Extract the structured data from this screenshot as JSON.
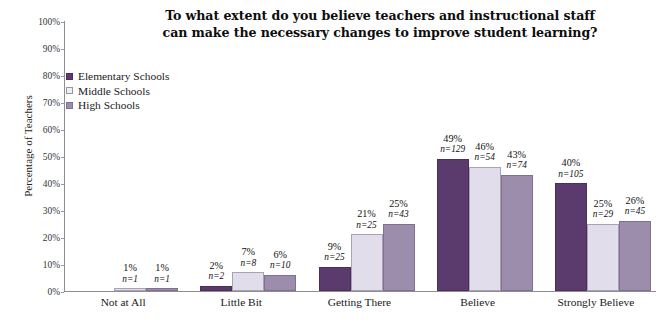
{
  "chart_data": {
    "type": "bar",
    "title": "To what extent do you believe teachers and instructional staff can make the necessary changes to improve student learning?",
    "title_lines": [
      "To what extent do you believe teachers and instructional staff",
      "can make the necessary changes to improve student learning?"
    ],
    "xlabel": "",
    "ylabel": "Percentage of Teachers",
    "ylim": [
      0,
      100
    ],
    "ytick_labels": [
      "0%",
      "10%",
      "20%",
      "30%",
      "40%",
      "50%",
      "60%",
      "70%",
      "80%",
      "90%",
      "100%"
    ],
    "ytick_values": [
      0,
      10,
      20,
      30,
      40,
      50,
      60,
      70,
      80,
      90,
      100
    ],
    "grid": false,
    "legend_position": "upper-left-inside",
    "categories": [
      "Not at All",
      "Little Bit",
      "Getting There",
      "Believe",
      "Strongly Believe"
    ],
    "series": [
      {
        "name": "Elementary Schools",
        "color": "#5B3A6E",
        "values": [
          0,
          2,
          9,
          49,
          40
        ],
        "value_labels": [
          "",
          "2%",
          "9%",
          "49%",
          "40%"
        ],
        "n": [
          null,
          2,
          25,
          129,
          105
        ],
        "n_labels": [
          "",
          "n=2",
          "n=25",
          "n=129",
          "n=105"
        ]
      },
      {
        "name": "Middle Schools",
        "color": "#E2DDEA",
        "values": [
          1,
          7,
          21,
          46,
          25
        ],
        "value_labels": [
          "1%",
          "7%",
          "21%",
          "46%",
          "25%"
        ],
        "n": [
          1,
          8,
          25,
          54,
          29
        ],
        "n_labels": [
          "n=1",
          "n=8",
          "n=25",
          "n=54",
          "n=29"
        ]
      },
      {
        "name": "High Schools",
        "color": "#9C8DAC",
        "values": [
          1,
          6,
          25,
          43,
          26
        ],
        "value_labels": [
          "1%",
          "6%",
          "25%",
          "43%",
          "26%"
        ],
        "n": [
          1,
          10,
          43,
          74,
          45
        ],
        "n_labels": [
          "n=1",
          "n=10",
          "n=43",
          "n=74",
          "n=45"
        ]
      }
    ]
  },
  "legend": {
    "items": [
      {
        "label": "Elementary Schools",
        "swatch": "elementary"
      },
      {
        "label": "Middle Schools",
        "swatch": "middle"
      },
      {
        "label": "High Schools",
        "swatch": "high"
      }
    ]
  }
}
